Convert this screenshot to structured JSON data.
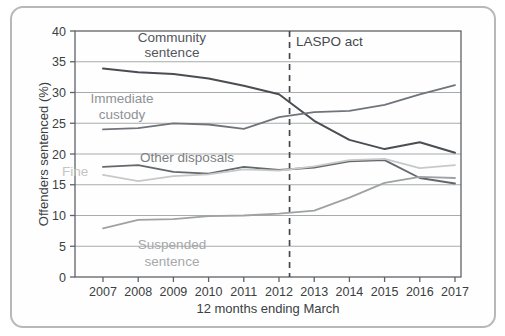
{
  "figure": {
    "ylabel": "Offenders sentenced (%)",
    "xlabel": "12 months ending March"
  },
  "chart_data": {
    "type": "line",
    "title": "",
    "xlabel": "12 months ending March",
    "ylabel": "Offenders sentenced (%)",
    "x": [
      2007,
      2008,
      2009,
      2010,
      2011,
      2012,
      2013,
      2014,
      2015,
      2016,
      2017
    ],
    "x_tick_labels": [
      "2007",
      "2008",
      "2009",
      "2010",
      "2011",
      "2012",
      "2013",
      "2014",
      "2015",
      "2016",
      "2017"
    ],
    "ylim": [
      0,
      40
    ],
    "ytick_step": 5,
    "y_tick_labels": [
      "0",
      "5",
      "10",
      "15",
      "20",
      "25",
      "30",
      "35",
      "40"
    ],
    "grid": true,
    "legend_position": "inline-labels",
    "series": [
      {
        "name": "Community sentence",
        "color": "#4a4d52",
        "stroke_width": 2,
        "values": [
          33.9,
          33.3,
          33.0,
          32.3,
          31.1,
          29.7,
          25.4,
          22.3,
          20.8,
          21.9,
          20.2
        ],
        "label": {
          "lines": [
            "Community",
            "sentence"
          ],
          "x": 172,
          "y": 42,
          "line_height": 15,
          "anchor": "middle",
          "color": "#53565b"
        }
      },
      {
        "name": "Immediate custody",
        "color": "#70747a",
        "stroke_width": 1.8,
        "values": [
          24.0,
          24.2,
          25.0,
          24.8,
          24.1,
          26.0,
          26.8,
          27.0,
          28.0,
          29.7,
          31.2
        ],
        "label": {
          "lines": [
            "Immediate",
            "custody"
          ],
          "x": 122,
          "y": 103,
          "line_height": 16,
          "anchor": "middle",
          "color": "#8f9295"
        }
      },
      {
        "name": "Other disposals",
        "color": "#64686c",
        "stroke_width": 1.8,
        "values": [
          17.9,
          18.2,
          17.1,
          16.8,
          17.9,
          17.4,
          17.8,
          18.8,
          19.0,
          16.1,
          15.2
        ],
        "label": {
          "lines": [
            "Other disposals"
          ],
          "x": 187,
          "y": 162,
          "line_height": 15,
          "anchor": "middle",
          "color": "#7b7e82"
        }
      },
      {
        "name": "Fine",
        "color": "#c7c9c8",
        "stroke_width": 1.8,
        "values": [
          16.6,
          15.6,
          16.4,
          16.7,
          17.5,
          17.3,
          18.0,
          19.0,
          19.2,
          17.7,
          18.2
        ],
        "label": {
          "lines": [
            "Fine"
          ],
          "x": 62,
          "y": 176,
          "line_height": 15,
          "anchor": "start",
          "color": "#c3c5c4"
        }
      },
      {
        "name": "Suspended sentence",
        "color": "#9fa2a3",
        "stroke_width": 1.8,
        "values": [
          7.9,
          9.3,
          9.4,
          9.9,
          10.0,
          10.3,
          10.8,
          12.9,
          15.3,
          16.3,
          16.1
        ],
        "label": {
          "lines": [
            "Suspended",
            "sentence"
          ],
          "x": 172,
          "y": 249,
          "line_height": 17,
          "anchor": "middle",
          "color": "#a6a8a9"
        }
      }
    ],
    "vline": {
      "x": 2012.3,
      "label": "LASPO act",
      "label_x": 296,
      "label_y": 46,
      "color": "#45484c",
      "dash": "6 5"
    },
    "colors": {
      "grid": "#a8aaac",
      "axis_border": "#5f6266",
      "frame_border": "#b6b8ba",
      "tick_text": "#3b3e42"
    }
  }
}
